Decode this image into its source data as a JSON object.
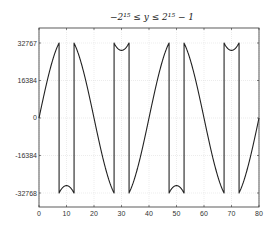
{
  "chart_data": {
    "type": "line",
    "title": "−2¹⁵ ≤ y ≤ 2¹⁵ − 1",
    "xlabel": "",
    "ylabel": "",
    "xlim": [
      0,
      80
    ],
    "ylim": [
      -32768,
      32767
    ],
    "grid": true,
    "legend": null,
    "x_ticks": [
      0,
      10,
      20,
      30,
      40,
      50,
      60,
      70,
      80
    ],
    "y_ticks": [
      32767,
      16384,
      0,
      -16384,
      -32768
    ],
    "y_tick_labels": [
      "32767",
      "16384",
      "0",
      "-16384",
      "-32768"
    ],
    "series": [
      {
        "name": "wrapped 16-bit sine",
        "description": "y = A·sin(2πx/40) with A≈36000, wrapped (integer overflow) into the signed 16-bit range",
        "amplitude": 36000,
        "period": 40,
        "wrap_range": [
          -32768,
          32767
        ],
        "wrap_points_x": [
          7.3,
          12.7,
          27.3,
          32.7,
          47.3,
          52.7,
          67.3,
          72.7
        ],
        "color": "#222222"
      }
    ]
  },
  "plot_colors": {
    "line": "#222222",
    "axis": "#333333",
    "grid": "#d9d9d9"
  }
}
